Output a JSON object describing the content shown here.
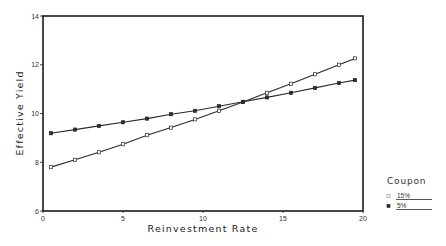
{
  "chart_data": {
    "type": "line",
    "title": "",
    "xlabel": "Reinvestment Rate",
    "ylabel": "Effective Yield",
    "xlim": [
      0,
      20
    ],
    "ylim": [
      6,
      14
    ],
    "x_ticks": [
      0,
      5,
      10,
      15,
      20
    ],
    "y_ticks": [
      6,
      8,
      10,
      12,
      14
    ],
    "grid": false,
    "legend": {
      "title": "Coupon",
      "position": "right-bottom-outside",
      "entries": [
        "15%",
        "5%"
      ]
    },
    "x": [
      0.5,
      2,
      3.5,
      5,
      6.5,
      8,
      9.5,
      11,
      12.5,
      14,
      15.5,
      17,
      18.5,
      19.5
    ],
    "series": [
      {
        "name": "15%",
        "marker": "open-square",
        "values": [
          7.8,
          8.1,
          8.41,
          8.74,
          9.11,
          9.42,
          9.76,
          10.11,
          10.47,
          10.85,
          11.22,
          11.61,
          12.0,
          12.26
        ]
      },
      {
        "name": "5%",
        "marker": "filled-square",
        "values": [
          9.19,
          9.34,
          9.49,
          9.64,
          9.79,
          9.97,
          10.11,
          10.3,
          10.48,
          10.66,
          10.85,
          11.05,
          11.25,
          11.37
        ]
      }
    ]
  },
  "colors": {
    "line": "#2a2a2a",
    "frame": "#1a1a1a",
    "background": "#ffffff"
  }
}
